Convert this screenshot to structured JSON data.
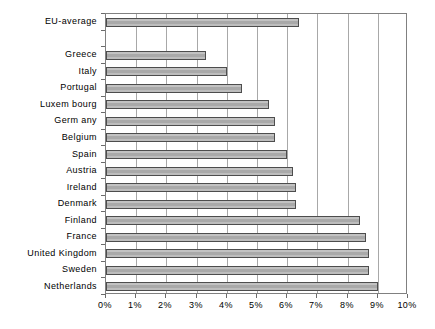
{
  "chart_data": {
    "type": "bar",
    "orientation": "horizontal",
    "title": "",
    "subtitle": "",
    "xlabel": "",
    "ylabel": "",
    "xlim": [
      0,
      10
    ],
    "ylim": null,
    "grid": true,
    "legend": false,
    "legend_position": "none",
    "tick_labels": [
      "0%",
      "1%",
      "2%",
      "3%",
      "4%",
      "5%",
      "6%",
      "7%",
      "8%",
      "9%",
      "10%"
    ],
    "tick_values": [
      0,
      1,
      2,
      3,
      4,
      5,
      6,
      7,
      8,
      9,
      10
    ],
    "value_unit": "%",
    "categories": [
      "EU-average",
      "",
      "Greece",
      "Italy",
      "Portugal",
      "Luxem bourg",
      "Germ any",
      "Belgium",
      "Spain",
      "Austria",
      "Ireland",
      "Denmark",
      "Finland",
      "France",
      "United Kingdom",
      "Sweden",
      "Netherlands"
    ],
    "values": [
      6.4,
      null,
      3.3,
      4.0,
      4.5,
      5.4,
      5.6,
      5.6,
      6.0,
      6.2,
      6.3,
      6.3,
      8.4,
      8.6,
      8.7,
      8.7,
      9.0
    ],
    "series": [
      {
        "name": "value",
        "values": [
          6.4,
          null,
          3.3,
          4.0,
          4.5,
          5.4,
          5.6,
          5.6,
          6.0,
          6.2,
          6.3,
          6.3,
          8.4,
          8.6,
          8.7,
          8.7,
          9.0
        ]
      }
    ],
    "colors": {
      "bar_fill": "#b4b4b4",
      "bar_border": "#4d4d4d",
      "gridline": "#a8a8a8",
      "frame": "#808080",
      "text": "#000000",
      "background": "#ffffff"
    }
  }
}
